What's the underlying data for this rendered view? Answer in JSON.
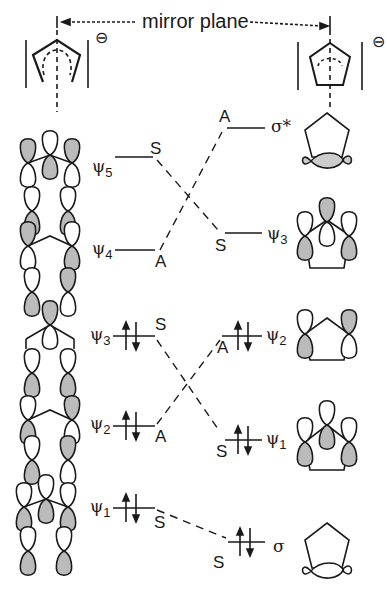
{
  "diagram": {
    "title": "mirror plane",
    "charge": "⊖",
    "left_molecule": "pentadienyl-type open chain (cyclopentadienyl before ring closure)",
    "right_molecule": "cyclopentyl ring",
    "left_levels": [
      {
        "name": "ψ",
        "sub": "5",
        "symmetry": "S",
        "occupied": false
      },
      {
        "name": "ψ",
        "sub": "4",
        "symmetry": "A",
        "occupied": false
      },
      {
        "name": "ψ",
        "sub": "3",
        "symmetry": "S",
        "occupied": true
      },
      {
        "name": "ψ",
        "sub": "2",
        "symmetry": "A",
        "occupied": true
      },
      {
        "name": "ψ",
        "sub": "1",
        "symmetry": "S",
        "occupied": true
      }
    ],
    "right_levels": [
      {
        "name": "σ*",
        "sub": "",
        "symmetry": "A",
        "occupied": false
      },
      {
        "name": "ψ",
        "sub": "3",
        "symmetry": "S",
        "occupied": false
      },
      {
        "name": "ψ",
        "sub": "2",
        "symmetry": "A",
        "occupied": true
      },
      {
        "name": "ψ",
        "sub": "1",
        "symmetry": "S",
        "occupied": true
      },
      {
        "name": "σ",
        "sub": "",
        "symmetry": "S",
        "occupied": true
      }
    ],
    "correlations": [
      [
        "ψ5 (S)",
        "ψ3 (S)"
      ],
      [
        "ψ4 (A)",
        "σ* (A)"
      ],
      [
        "ψ3 (S)",
        "ψ1 (S)"
      ],
      [
        "ψ2 (A)",
        "ψ2 (A)"
      ],
      [
        "ψ1 (S)",
        "σ (S)"
      ]
    ]
  },
  "labels": {
    "l5": "ψ",
    "l5s": "5",
    "l5sym": "S",
    "l4": "ψ",
    "l4s": "4",
    "l4sym": "A",
    "l3": "ψ",
    "l3s": "3",
    "l3sym": "S",
    "l2": "ψ",
    "l2s": "2",
    "l2sym": "A",
    "l1": "ψ",
    "l1s": "1",
    "l1sym": "S",
    "rstar": "σ*",
    "rstarsym": "A",
    "r3": "ψ",
    "r3s": "3",
    "r3sym": "S",
    "r2": "ψ",
    "r2s": "2",
    "r2sym": "A",
    "r1": "ψ",
    "r1s": "1",
    "r1sym": "S",
    "rsig": "σ",
    "rsigsym": "S",
    "charge": "⊖"
  }
}
